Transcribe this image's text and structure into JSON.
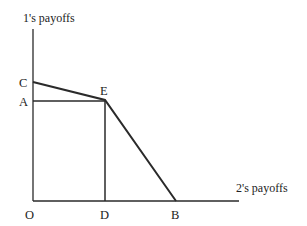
{
  "diagram": {
    "y_axis_label": "1's payoffs",
    "x_axis_label": "2's payoffs",
    "points": {
      "O": "O",
      "C": "C",
      "A": "A",
      "E": "E",
      "D": "D",
      "B": "B"
    },
    "geometry": {
      "origin": [
        33,
        201
      ],
      "y_axis_top": [
        33,
        29
      ],
      "x_axis_end": [
        239,
        201
      ],
      "C": [
        33,
        82
      ],
      "A": [
        33,
        101
      ],
      "E": [
        105,
        101
      ],
      "D": [
        105,
        201
      ],
      "B": [
        176,
        201
      ]
    },
    "segments": [
      {
        "from": "C",
        "to": "E",
        "type": "frontier"
      },
      {
        "from": "E",
        "to": "B",
        "type": "frontier"
      },
      {
        "from": "A",
        "to": "E",
        "type": "guide"
      },
      {
        "from": "E",
        "to": "D",
        "type": "guide"
      }
    ],
    "colors": {
      "line": "#2a2a2a",
      "text": "#222222",
      "background": "#ffffff"
    }
  }
}
